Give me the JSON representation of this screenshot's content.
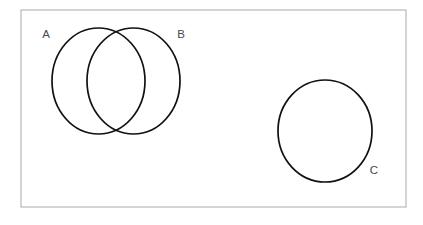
{
  "figure": {
    "background_color": "#ffffff",
    "frame": {
      "name": "diagram-border",
      "x": 21,
      "y": 10,
      "width": 385,
      "height": 197,
      "stroke_color": "#a9a9a9",
      "stroke_width": 1,
      "fill": "none"
    }
  },
  "chart_data": {
    "type": "venn",
    "title": "",
    "xlabel": "",
    "ylabel": "",
    "grid": false,
    "legend_position": "none",
    "stroke_color": "#111111",
    "stroke_width": 1.7,
    "fill": "none",
    "sets": [
      {
        "id": "A",
        "label": "A",
        "cx": 98.5,
        "cy": 81,
        "rx": 46.5,
        "ry": 53,
        "label_x": 46,
        "label_y": 35
      },
      {
        "id": "B",
        "label": "B",
        "cx": 133.5,
        "cy": 81,
        "rx": 46.5,
        "ry": 53,
        "label_x": 181,
        "label_y": 35
      },
      {
        "id": "C",
        "label": "C",
        "cx": 325,
        "cy": 131,
        "rx": 47,
        "ry": 51,
        "label_x": 374,
        "label_y": 171
      }
    ],
    "relations": [
      {
        "sets": [
          "A",
          "B"
        ],
        "type": "overlapping",
        "region": "intersection"
      },
      {
        "sets": [
          "C"
        ],
        "type": "disjoint",
        "region": "separate"
      }
    ]
  }
}
